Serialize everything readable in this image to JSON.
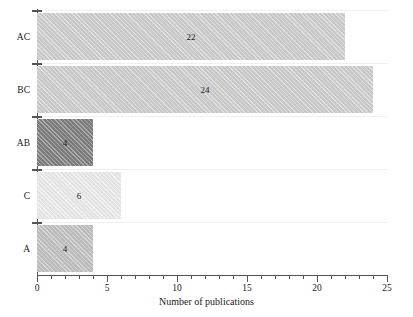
{
  "chart_data": {
    "type": "bar",
    "orientation": "horizontal",
    "title": "",
    "xlabel": "Number of publications",
    "ylabel": "",
    "categories": [
      "A",
      "C",
      "AB",
      "BC",
      "AC"
    ],
    "values": [
      4,
      6,
      4,
      24,
      22
    ],
    "bar_labels": [
      "4",
      "6",
      "4",
      "24",
      "22"
    ],
    "bar_colors": [
      "#c2c2c2",
      "#ebebeb",
      "#808080",
      "#cfcfcf",
      "#cfcfcf"
    ],
    "xlim": [
      0,
      25.5
    ],
    "xticks": [
      0,
      5,
      10,
      15,
      20,
      25
    ],
    "xtick_labels": [
      "0",
      "5",
      "10",
      "15",
      "20",
      "25"
    ],
    "minor_ticks_per_interval": 4,
    "grid": false,
    "legend": null,
    "axis_color": "#555555"
  },
  "axis": {
    "title_x": "Number of publications"
  }
}
